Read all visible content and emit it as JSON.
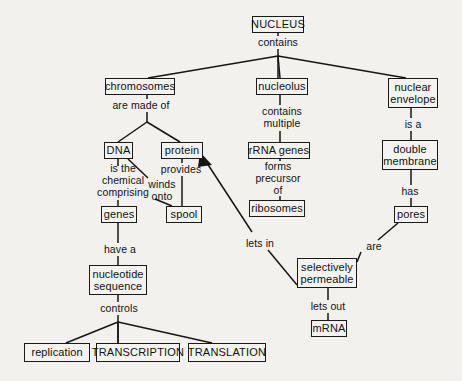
{
  "diagram": {
    "type": "concept-map",
    "background_color": "#f2f1ee",
    "line_color": "#151515",
    "box_border_color": "#1a1a1a",
    "nodes": [
      {
        "id": "nucleus",
        "label": "NUCLEUS",
        "x": 252,
        "y": 16,
        "w": 52,
        "h": 17,
        "style": "caps"
      },
      {
        "id": "chromosomes",
        "label": "chromosomes",
        "x": 105,
        "y": 78,
        "w": 70,
        "h": 17,
        "style": "normal"
      },
      {
        "id": "nucleolus",
        "label": "nucleolus",
        "x": 256,
        "y": 78,
        "w": 52,
        "h": 17,
        "style": "normal"
      },
      {
        "id": "nuclear_envelope",
        "label": "nuclear\nenvelope",
        "x": 388,
        "y": 78,
        "w": 50,
        "h": 30,
        "style": "normal"
      },
      {
        "id": "dna",
        "label": "DNA",
        "x": 104,
        "y": 142,
        "w": 29,
        "h": 17,
        "style": "caps"
      },
      {
        "id": "protein",
        "label": "protein",
        "x": 161,
        "y": 142,
        "w": 42,
        "h": 17,
        "style": "normal"
      },
      {
        "id": "rrna_genes",
        "label": "rRNA genes",
        "x": 248,
        "y": 142,
        "w": 62,
        "h": 17,
        "style": "normal"
      },
      {
        "id": "double_membrane",
        "label": "double\nmembrane",
        "x": 382,
        "y": 140,
        "w": 56,
        "h": 30,
        "style": "normal"
      },
      {
        "id": "genes",
        "label": "genes",
        "x": 101,
        "y": 206,
        "w": 36,
        "h": 17,
        "style": "normal"
      },
      {
        "id": "spool",
        "label": "spool",
        "x": 166,
        "y": 206,
        "w": 36,
        "h": 17,
        "style": "normal"
      },
      {
        "id": "ribosomes",
        "label": "ribosomes",
        "x": 249,
        "y": 200,
        "w": 56,
        "h": 17,
        "style": "normal"
      },
      {
        "id": "pores",
        "label": "pores",
        "x": 394,
        "y": 206,
        "w": 34,
        "h": 17,
        "style": "normal"
      },
      {
        "id": "nucleotide_sequence",
        "label": "nucleotide\nsequence",
        "x": 89,
        "y": 265,
        "w": 58,
        "h": 30,
        "style": "normal"
      },
      {
        "id": "selectively_permeable",
        "label": "selectively\npermeable",
        "x": 297,
        "y": 258,
        "w": 60,
        "h": 30,
        "style": "normal"
      },
      {
        "id": "mrna",
        "label": "mRNA",
        "x": 311,
        "y": 320,
        "w": 36,
        "h": 17,
        "style": "normal"
      },
      {
        "id": "replication",
        "label": "replication",
        "x": 24,
        "y": 343,
        "w": 66,
        "h": 19,
        "style": "normal"
      },
      {
        "id": "transcription",
        "label": "TRANSCRIPTION",
        "x": 96,
        "y": 343,
        "w": 84,
        "h": 19,
        "style": "caps"
      },
      {
        "id": "translation",
        "label": "TRANSLATION",
        "x": 188,
        "y": 343,
        "w": 78,
        "h": 19,
        "style": "caps"
      }
    ],
    "link_labels": [
      {
        "id": "contains",
        "text": "contains",
        "x": 250,
        "y": 36,
        "w": 56
      },
      {
        "id": "are_made_of",
        "text": "are made of",
        "x": 110,
        "y": 99,
        "w": 62
      },
      {
        "id": "contains_multiple",
        "text": "contains\nmultiple",
        "x": 253,
        "y": 105,
        "w": 58
      },
      {
        "id": "is_a",
        "text": "is a",
        "x": 396,
        "y": 118,
        "w": 34
      },
      {
        "id": "is_the_chemical_comprising",
        "text": "is the\nchemical\ncomprising",
        "x": 92,
        "y": 162,
        "w": 62
      },
      {
        "id": "winds_onto",
        "text": "winds\nonto",
        "x": 144,
        "y": 178,
        "w": 36
      },
      {
        "id": "provides",
        "text": "provides",
        "x": 155,
        "y": 163,
        "w": 52
      },
      {
        "id": "forms_precursor_of",
        "text": "forms\nprecursor\nof",
        "x": 248,
        "y": 160,
        "w": 60
      },
      {
        "id": "has",
        "text": "has",
        "x": 396,
        "y": 185,
        "w": 28
      },
      {
        "id": "have_a",
        "text": "have a",
        "x": 99,
        "y": 243,
        "w": 42
      },
      {
        "id": "lets_in",
        "text": "lets in",
        "x": 240,
        "y": 237,
        "w": 40
      },
      {
        "id": "are",
        "text": "are",
        "x": 362,
        "y": 240,
        "w": 24
      },
      {
        "id": "controls",
        "text": "controls",
        "x": 95,
        "y": 302,
        "w": 48
      },
      {
        "id": "lets_out",
        "text": "lets out",
        "x": 305,
        "y": 300,
        "w": 46
      }
    ],
    "edges": [
      {
        "id": "nucleus-contains",
        "from": "nucleus",
        "to": "contains-junction",
        "kind": "line"
      },
      {
        "id": "contains-chromosomes",
        "from": "contains",
        "to": "chromosomes",
        "kind": "line"
      },
      {
        "id": "contains-nucleolus",
        "from": "contains",
        "to": "nucleolus",
        "kind": "line"
      },
      {
        "id": "contains-nuclear-envelope",
        "from": "contains",
        "to": "nuclear_envelope",
        "kind": "line"
      },
      {
        "id": "chromosomes-dna",
        "from": "chromosomes",
        "to": "dna",
        "kind": "line"
      },
      {
        "id": "chromosomes-protein",
        "from": "chromosomes",
        "to": "protein",
        "kind": "line"
      },
      {
        "id": "dna-genes",
        "from": "dna",
        "to": "genes",
        "kind": "line"
      },
      {
        "id": "dna-spool",
        "from": "dna",
        "to": "spool",
        "kind": "line"
      },
      {
        "id": "protein-spool",
        "from": "protein",
        "to": "spool",
        "kind": "line"
      },
      {
        "id": "nucleolus-rrna-genes",
        "from": "nucleolus",
        "to": "rrna_genes",
        "kind": "line"
      },
      {
        "id": "rrna-genes-ribosomes",
        "from": "rrna_genes",
        "to": "ribosomes",
        "kind": "line"
      },
      {
        "id": "nuclear-envelope-double-membrane",
        "from": "nuclear_envelope",
        "to": "double_membrane",
        "kind": "line"
      },
      {
        "id": "double-membrane-pores",
        "from": "double_membrane",
        "to": "pores",
        "kind": "line"
      },
      {
        "id": "pores-selectively-permeable",
        "from": "pores",
        "to": "selectively_permeable",
        "kind": "line"
      },
      {
        "id": "selectively-permeable-mrna",
        "from": "selectively_permeable",
        "to": "mrna",
        "kind": "line"
      },
      {
        "id": "selectively-permeable-protein",
        "from": "selectively_permeable",
        "to": "protein",
        "kind": "arrow"
      },
      {
        "id": "genes-nucleotide-sequence",
        "from": "genes",
        "to": "nucleotide_sequence",
        "kind": "line"
      },
      {
        "id": "nucleotide-sequence-replication",
        "from": "nucleotide_sequence",
        "to": "replication",
        "kind": "line"
      },
      {
        "id": "nucleotide-sequence-transcription",
        "from": "nucleotide_sequence",
        "to": "transcription",
        "kind": "line"
      },
      {
        "id": "nucleotide-sequence-translation",
        "from": "nucleotide_sequence",
        "to": "translation",
        "kind": "line"
      }
    ]
  }
}
